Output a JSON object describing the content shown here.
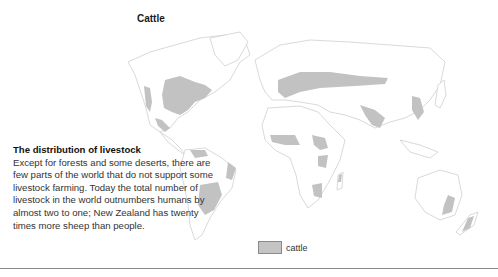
{
  "title": "Cattle",
  "caption": {
    "heading": "The distribution of livestock",
    "body": "Except for forests and some deserts, there are few parts of the world that do not support some livestock farming. Today the total number of livestock in the world outnumbers humans by almost two to one; New Zealand has twenty times more sheep than people."
  },
  "legend": {
    "items": [
      {
        "label": "cattle",
        "color": "#c4c4c4"
      }
    ]
  },
  "colors": {
    "cattle_fill": "#c2c2c2",
    "land_outline": "#cfcfcf",
    "rule": "#8a8a8a"
  }
}
